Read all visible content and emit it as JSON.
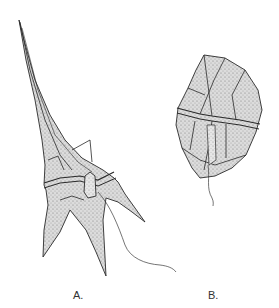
{
  "figure": {
    "panels": [
      {
        "id": "A",
        "label": "A.",
        "subject": "dinoflagellate with long apical horn and three antapical horns, flagellum trailing"
      },
      {
        "id": "B",
        "label": "B.",
        "subject": "rounded armored dinoflagellate with thecal plates and girdle, flagellum trailing"
      }
    ],
    "colors": {
      "background": "#ffffff",
      "ink": "#2a2a2a",
      "stipple": "#8a8a8a",
      "fill": "#d6d6d6"
    }
  }
}
